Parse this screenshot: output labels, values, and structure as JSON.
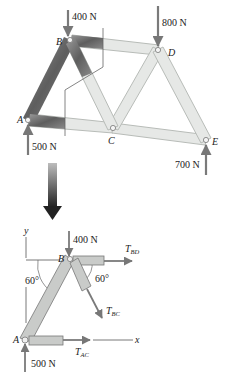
{
  "truss": {
    "joints": {
      "A": {
        "label": "A",
        "x": 28,
        "y": 120
      },
      "B": {
        "label": "B",
        "x": 70,
        "y": 40
      },
      "C": {
        "label": "C",
        "x": 113,
        "y": 128
      },
      "D": {
        "label": "D",
        "x": 158,
        "y": 50
      },
      "E": {
        "label": "E",
        "x": 206,
        "y": 140
      }
    },
    "members": [
      "AB",
      "BC",
      "BD",
      "AC",
      "CD",
      "CE",
      "DE"
    ],
    "loads": [
      {
        "joint": "B",
        "label": "400 N",
        "direction": "down"
      },
      {
        "joint": "D",
        "label": "800 N",
        "direction": "down"
      },
      {
        "joint": "A",
        "label": "500 N",
        "direction": "up"
      },
      {
        "joint": "E",
        "label": "700 N",
        "direction": "up"
      }
    ]
  },
  "fbd": {
    "joints": {
      "A": "A",
      "B": "B"
    },
    "loads": {
      "top": "400 N",
      "bottom": "500 N"
    },
    "forces": {
      "bd": {
        "symbol": "T",
        "sub": "BD"
      },
      "bc": {
        "symbol": "T",
        "sub": "BC"
      },
      "ac": {
        "symbol": "T",
        "sub": "AC"
      }
    },
    "angles": {
      "left": "60°",
      "right": "60°"
    },
    "axes": {
      "x": "x",
      "y": "y"
    }
  },
  "colors": {
    "member_light": "#e4e6e4",
    "member_dark": "#6e6e6e",
    "arrow": "#7a7a7a",
    "line": "#555555"
  }
}
